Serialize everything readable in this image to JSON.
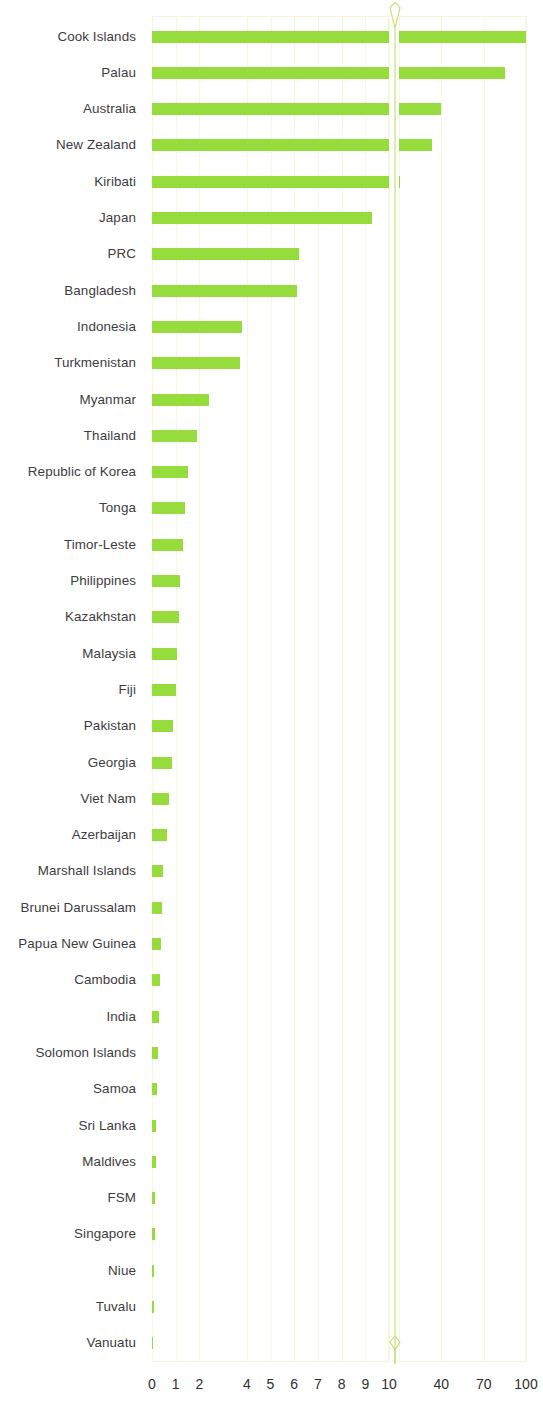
{
  "chart_data": {
    "type": "bar",
    "orientation": "horizontal",
    "title": "",
    "xlabel": "",
    "ylabel": "",
    "grid": true,
    "legend": null,
    "bar_color": "#96DC3C",
    "broken_axis": true,
    "axis_break_label": "axis-break-marker",
    "x_tick_labels": [
      "0",
      "1",
      "2",
      "4",
      "5",
      "6",
      "7",
      "8",
      "9",
      "10",
      "40",
      "70",
      "100"
    ],
    "x_tick_values": [
      0,
      1,
      2,
      4,
      5,
      6,
      7,
      8,
      9,
      10,
      40,
      70,
      100
    ],
    "segment_left_range": [
      0,
      10
    ],
    "segment_right_range": [
      10,
      100
    ],
    "categories": [
      "Cook Islands",
      "Palau",
      "Australia",
      "New Zealand",
      "Kiribati",
      "Japan",
      "PRC",
      "Bangladesh",
      "Indonesia",
      "Turkmenistan",
      "Myanmar",
      "Thailand",
      "Republic of Korea",
      "Tonga",
      "Timor-Leste",
      "Philippines",
      "Kazakhstan",
      "Malaysia",
      "Fiji",
      "Pakistan",
      "Georgia",
      "Viet Nam",
      "Azerbaijan",
      "Marshall Islands",
      "Brunei Darussalam",
      "Papua New Guinea",
      "Cambodia",
      "India",
      "Solomon Islands",
      "Samoa",
      "Sri Lanka",
      "Maldives",
      "FSM",
      "Singapore",
      "Niue",
      "Tuvalu",
      "Vanuatu"
    ],
    "values": [
      100,
      85,
      40,
      33,
      10.1,
      9.3,
      6.2,
      6.1,
      3.8,
      3.7,
      2.4,
      1.9,
      1.5,
      1.4,
      1.3,
      1.2,
      1.15,
      1.05,
      1.0,
      0.9,
      0.85,
      0.7,
      0.65,
      0.45,
      0.4,
      0.38,
      0.33,
      0.3,
      0.26,
      0.22,
      0.18,
      0.15,
      0.13,
      0.11,
      0.09,
      0.07,
      0.05
    ]
  }
}
